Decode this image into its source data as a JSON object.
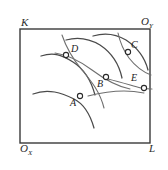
{
  "figure": {
    "box": {
      "x": 20,
      "y": 29,
      "width": 130,
      "height": 114,
      "stroke": "#3a3a3a",
      "stroke_width": 1.4
    },
    "colors": {
      "curve_family_x": "#4a4a4a",
      "curve_family_y": "#6e6e6e",
      "box_border": "#3a3a3a",
      "marker_fill": "#ffffff",
      "marker_stroke": "#2a2a2a",
      "text": "#1c1c1c",
      "background": "#ffffff"
    },
    "corner_labels": [
      {
        "id": "K",
        "base": "K",
        "sub": "",
        "x": 21,
        "y": 17
      },
      {
        "id": "OY",
        "base": "O",
        "sub": "Y",
        "x": 141,
        "y": 16
      },
      {
        "id": "OX",
        "base": "O",
        "sub": "X",
        "x": 20,
        "y": 143
      },
      {
        "id": "L",
        "base": "L",
        "sub": "",
        "x": 149,
        "y": 143
      }
    ],
    "points": [
      {
        "id": "A",
        "label": "A",
        "x": 80,
        "y": 96,
        "label_x": 70,
        "label_y": 98
      },
      {
        "id": "B",
        "label": "B",
        "x": 106,
        "y": 77,
        "label_x": 97,
        "label_y": 79
      },
      {
        "id": "C",
        "label": "C",
        "x": 128,
        "y": 52,
        "label_x": 131,
        "label_y": 40
      },
      {
        "id": "D",
        "label": "D",
        "x": 66,
        "y": 55,
        "label_x": 71,
        "label_y": 44
      },
      {
        "id": "E",
        "label": "E",
        "x": 144,
        "y": 88,
        "label_x": 131,
        "label_y": 73
      }
    ],
    "marker_radius": 2.6,
    "curves_family_x": [
      "M 33,94 C 48,88 62,93 74,99 C 84,104 90,114 94,128",
      "M 41,56 C 54,52 62,55 73,62 C 84,69 91,80 95,95",
      "M 66,40 C 80,36 90,39 100,45 C 112,53 119,64 122,78",
      "M 93,36 C 106,32 116,34 126,40 C 138,48 145,58 148,70"
    ],
    "curves_family_y": [
      "M 55,53 C 68,55 80,61 92,70 C 104,79 115,86 130,89",
      "M 62,35 C 66,47 72,58 82,70 C 92,82 100,92 104,108",
      "M 108,79 C 120,82 130,85 141,88 C 147,89 150,89 152,89",
      "M 88,96 C 100,93 112,91 124,91 C 133,91 139,92 144,93",
      "M 118,33 C 120,42 123,50 129,58 C 136,67 143,72 151,75"
    ]
  }
}
